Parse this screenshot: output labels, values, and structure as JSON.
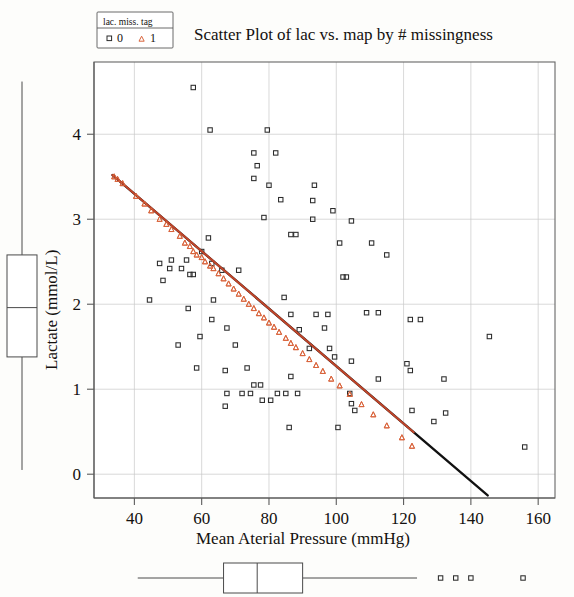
{
  "chart_data": {
    "type": "scatter",
    "title": "Scatter Plot of lac vs. map by # missingness",
    "xlabel": "Mean Aterial Pressure (mmHg)",
    "ylabel": "Lactate (mmol/L)",
    "xlim": [
      28,
      165
    ],
    "ylim": [
      -0.28,
      4.85
    ],
    "xticks": [
      40,
      60,
      80,
      100,
      120,
      140,
      160
    ],
    "yticks": [
      0,
      1,
      2,
      3,
      4
    ],
    "grid": true,
    "legend": {
      "title": "lac. miss. tag",
      "position": "top-left-outside",
      "entries": [
        {
          "label": "0",
          "marker": "square",
          "color": "#2b2b2b"
        },
        {
          "label": "1",
          "marker": "triangle",
          "color": "#d9643c"
        }
      ]
    },
    "series": [
      {
        "name": "0",
        "marker": "square",
        "color": "#2b2b2b",
        "points": [
          [
            57.5,
            4.55
          ],
          [
            62.5,
            4.05
          ],
          [
            79.5,
            4.05
          ],
          [
            75.5,
            3.78
          ],
          [
            82.0,
            3.78
          ],
          [
            76.5,
            3.63
          ],
          [
            75.5,
            3.48
          ],
          [
            80.0,
            3.4
          ],
          [
            93.5,
            3.4
          ],
          [
            83.5,
            3.23
          ],
          [
            93.0,
            3.22
          ],
          [
            99.0,
            3.1
          ],
          [
            78.5,
            3.02
          ],
          [
            93.0,
            3.0
          ],
          [
            104.5,
            2.98
          ],
          [
            86.5,
            2.82
          ],
          [
            88.0,
            2.82
          ],
          [
            62.0,
            2.78
          ],
          [
            101.0,
            2.72
          ],
          [
            110.5,
            2.72
          ],
          [
            60.0,
            2.62
          ],
          [
            115.0,
            2.58
          ],
          [
            47.5,
            2.48
          ],
          [
            51.0,
            2.52
          ],
          [
            55.5,
            2.52
          ],
          [
            63.0,
            2.48
          ],
          [
            50.5,
            2.42
          ],
          [
            54.0,
            2.42
          ],
          [
            66.0,
            2.4
          ],
          [
            56.5,
            2.35
          ],
          [
            57.5,
            2.35
          ],
          [
            71.0,
            2.4
          ],
          [
            48.5,
            2.28
          ],
          [
            102.0,
            2.32
          ],
          [
            103.0,
            2.32
          ],
          [
            44.5,
            2.05
          ],
          [
            63.5,
            2.05
          ],
          [
            84.5,
            2.08
          ],
          [
            56.0,
            1.95
          ],
          [
            86.5,
            1.88
          ],
          [
            94.0,
            1.88
          ],
          [
            97.5,
            1.88
          ],
          [
            109.0,
            1.9
          ],
          [
            112.5,
            1.9
          ],
          [
            63.0,
            1.82
          ],
          [
            122.0,
            1.82
          ],
          [
            125.0,
            1.82
          ],
          [
            67.5,
            1.72
          ],
          [
            89.0,
            1.7
          ],
          [
            96.5,
            1.72
          ],
          [
            59.5,
            1.62
          ],
          [
            145.5,
            1.62
          ],
          [
            53.0,
            1.52
          ],
          [
            70.0,
            1.52
          ],
          [
            92.0,
            1.48
          ],
          [
            98.0,
            1.48
          ],
          [
            99.5,
            1.38
          ],
          [
            104.5,
            1.33
          ],
          [
            58.5,
            1.25
          ],
          [
            67.0,
            1.22
          ],
          [
            73.5,
            1.25
          ],
          [
            121.0,
            1.3
          ],
          [
            122.0,
            1.22
          ],
          [
            86.5,
            1.15
          ],
          [
            112.5,
            1.12
          ],
          [
            132.0,
            1.12
          ],
          [
            75.5,
            1.05
          ],
          [
            77.5,
            1.05
          ],
          [
            67.5,
            0.95
          ],
          [
            72.0,
            0.95
          ],
          [
            74.5,
            0.95
          ],
          [
            82.5,
            0.95
          ],
          [
            85.0,
            0.95
          ],
          [
            88.5,
            0.95
          ],
          [
            104.0,
            0.95
          ],
          [
            78.0,
            0.87
          ],
          [
            80.5,
            0.87
          ],
          [
            104.5,
            0.83
          ],
          [
            105.5,
            0.75
          ],
          [
            122.5,
            0.75
          ],
          [
            132.5,
            0.72
          ],
          [
            67.0,
            0.8
          ],
          [
            86.0,
            0.55
          ],
          [
            100.5,
            0.55
          ],
          [
            129.0,
            0.62
          ],
          [
            156.0,
            0.32
          ]
        ]
      },
      {
        "name": "1",
        "marker": "triangle",
        "color": "#d9643c",
        "points": [
          [
            34.0,
            3.5
          ],
          [
            35.0,
            3.47
          ],
          [
            36.5,
            3.42
          ],
          [
            40.5,
            3.27
          ],
          [
            43.0,
            3.18
          ],
          [
            45.0,
            3.1
          ],
          [
            47.5,
            3.0
          ],
          [
            49.5,
            2.94
          ],
          [
            51.0,
            2.88
          ],
          [
            53.5,
            2.8
          ],
          [
            55.0,
            2.72
          ],
          [
            56.5,
            2.68
          ],
          [
            57.5,
            2.62
          ],
          [
            58.5,
            2.58
          ],
          [
            60.0,
            2.55
          ],
          [
            61.0,
            2.5
          ],
          [
            62.5,
            2.45
          ],
          [
            63.5,
            2.42
          ],
          [
            65.0,
            2.36
          ],
          [
            66.5,
            2.3
          ],
          [
            68.0,
            2.24
          ],
          [
            69.5,
            2.18
          ],
          [
            71.0,
            2.12
          ],
          [
            72.5,
            2.06
          ],
          [
            74.0,
            2.0
          ],
          [
            75.5,
            1.95
          ],
          [
            77.0,
            1.89
          ],
          [
            78.5,
            1.84
          ],
          [
            80.0,
            1.78
          ],
          [
            81.5,
            1.73
          ],
          [
            83.0,
            1.67
          ],
          [
            85.0,
            1.6
          ],
          [
            86.5,
            1.54
          ],
          [
            88.0,
            1.49
          ],
          [
            90.0,
            1.42
          ],
          [
            92.0,
            1.35
          ],
          [
            94.0,
            1.28
          ],
          [
            96.0,
            1.21
          ],
          [
            98.5,
            1.12
          ],
          [
            101.0,
            1.04
          ],
          [
            104.0,
            0.94
          ],
          [
            107.5,
            0.82
          ],
          [
            111.0,
            0.7
          ],
          [
            115.0,
            0.57
          ],
          [
            119.5,
            0.43
          ],
          [
            122.5,
            0.33
          ]
        ]
      }
    ],
    "fit_line": {
      "name": "regression-line",
      "x_start": 33.5,
      "y_start": 3.52,
      "x_end": 145.0,
      "y_end": -0.25,
      "orange_end_x": 123.0,
      "color_main": "#111111",
      "color_overlay": "#c0452a"
    },
    "marginal_boxplots": {
      "y_box": {
        "orientation": "vertical",
        "whisker_low": 0.05,
        "q1": 1.38,
        "median": 1.96,
        "q3": 2.58,
        "whisker_high": 4.62,
        "outliers": []
      },
      "x_box": {
        "orientation": "horizontal",
        "whisker_low": 41.0,
        "q1": 66.5,
        "median": 76.5,
        "q3": 90.0,
        "whisker_high": 124.0,
        "outliers": [
          131.0,
          135.5,
          140.0,
          155.5
        ]
      }
    }
  }
}
